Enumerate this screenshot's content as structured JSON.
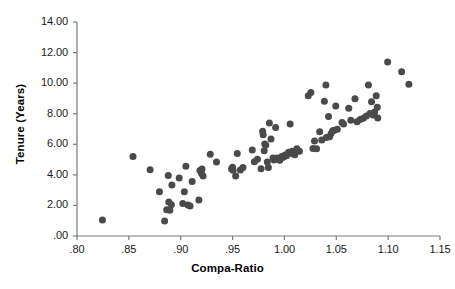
{
  "chart_data": {
    "type": "scatter",
    "title": "",
    "xlabel": "Compa-Ratio",
    "ylabel": "Tenure (Years)",
    "xlim": [
      0.8,
      1.15
    ],
    "ylim": [
      0.0,
      14.0
    ],
    "xticks": [
      0.8,
      0.85,
      0.9,
      0.95,
      1.0,
      1.05,
      1.1,
      1.15
    ],
    "xtick_labels": [
      ".80",
      ".85",
      ".90",
      ".95",
      "1.00",
      "1.05",
      "1.10",
      "1.15"
    ],
    "yticks": [
      0,
      2,
      4,
      6,
      8,
      10,
      12,
      14
    ],
    "ytick_labels": [
      ".00",
      "2.00",
      "4.00",
      "6.00",
      "8.00",
      "10.00",
      "12.00",
      "14.00"
    ],
    "grid": false,
    "legend": null,
    "marker": {
      "shape": "circle",
      "color": "#4a4a4a",
      "size_px": 7
    },
    "series": [
      {
        "name": "Employees",
        "points": [
          [
            0.8245,
            1.05
          ],
          [
            0.854,
            5.2
          ],
          [
            0.8705,
            4.33
          ],
          [
            0.8795,
            2.9
          ],
          [
            0.8845,
            0.98
          ],
          [
            0.8865,
            1.72
          ],
          [
            0.888,
            3.95
          ],
          [
            0.8885,
            2.22
          ],
          [
            0.8895,
            1.68
          ],
          [
            0.891,
            2.05
          ],
          [
            0.8915,
            3.34
          ],
          [
            0.8985,
            3.8
          ],
          [
            0.902,
            2.12
          ],
          [
            0.9035,
            2.9
          ],
          [
            0.905,
            4.57
          ],
          [
            0.907,
            2.02
          ],
          [
            0.909,
            1.97
          ],
          [
            0.911,
            3.56
          ],
          [
            0.9175,
            2.35
          ],
          [
            0.9185,
            4.28
          ],
          [
            0.92,
            4.1
          ],
          [
            0.9205,
            4.38
          ],
          [
            0.9215,
            3.92
          ],
          [
            0.9285,
            5.34
          ],
          [
            0.9345,
            4.84
          ],
          [
            0.949,
            4.38
          ],
          [
            0.95,
            4.5
          ],
          [
            0.9505,
            4.3
          ],
          [
            0.953,
            3.92
          ],
          [
            0.9545,
            5.4
          ],
          [
            0.9575,
            4.32
          ],
          [
            0.96,
            4.48
          ],
          [
            0.969,
            5.62
          ],
          [
            0.971,
            4.86
          ],
          [
            0.974,
            5.02
          ],
          [
            0.9775,
            4.4
          ],
          [
            0.979,
            6.85
          ],
          [
            0.9795,
            6.62
          ],
          [
            0.9805,
            5.58
          ],
          [
            0.981,
            6.02
          ],
          [
            0.982,
            5.95
          ],
          [
            0.9835,
            4.84
          ],
          [
            0.9845,
            4.48
          ],
          [
            0.9855,
            7.4
          ],
          [
            0.987,
            6.35
          ],
          [
            0.989,
            5.1
          ],
          [
            0.99,
            4.98
          ],
          [
            0.9915,
            7.1
          ],
          [
            0.993,
            5.1
          ],
          [
            0.9945,
            5.05
          ],
          [
            0.9955,
            4.95
          ],
          [
            0.9975,
            5.2
          ],
          [
            0.999,
            5.15
          ],
          [
            1.0005,
            5.3
          ],
          [
            1.002,
            5.25
          ],
          [
            1.004,
            5.48
          ],
          [
            1.0055,
            7.32
          ],
          [
            1.006,
            5.42
          ],
          [
            1.0075,
            5.55
          ],
          [
            1.0085,
            5.38
          ],
          [
            1.01,
            5.32
          ],
          [
            1.012,
            5.7
          ],
          [
            1.0145,
            5.55
          ],
          [
            1.023,
            9.18
          ],
          [
            1.0255,
            9.38
          ],
          [
            1.0275,
            5.72
          ],
          [
            1.029,
            6.22
          ],
          [
            1.031,
            5.7
          ],
          [
            1.034,
            6.82
          ],
          [
            1.036,
            6.28
          ],
          [
            1.0385,
            8.82
          ],
          [
            1.04,
            9.88
          ],
          [
            1.0405,
            6.45
          ],
          [
            1.0425,
            7.82
          ],
          [
            1.0435,
            6.5
          ],
          [
            1.045,
            6.7
          ],
          [
            1.0465,
            6.88
          ],
          [
            1.048,
            6.92
          ],
          [
            1.0495,
            8.5
          ],
          [
            1.051,
            6.98
          ],
          [
            1.0555,
            7.42
          ],
          [
            1.057,
            7.32
          ],
          [
            1.062,
            8.35
          ],
          [
            1.064,
            7.58
          ],
          [
            1.068,
            8.98
          ],
          [
            1.07,
            7.48
          ],
          [
            1.073,
            7.62
          ],
          [
            1.076,
            7.7
          ],
          [
            1.079,
            7.85
          ],
          [
            1.081,
            9.88
          ],
          [
            1.0825,
            8.02
          ],
          [
            1.084,
            8.78
          ],
          [
            1.0855,
            7.92
          ],
          [
            1.087,
            8.12
          ],
          [
            1.0885,
            9.18
          ],
          [
            1.0895,
            8.42
          ],
          [
            1.09,
            7.72
          ],
          [
            1.0995,
            11.38
          ],
          [
            1.113,
            10.75
          ],
          [
            1.12,
            9.92
          ]
        ]
      }
    ]
  },
  "axes": {
    "x_axis_name": "compa-ratio-axis",
    "y_axis_name": "tenure-axis"
  }
}
